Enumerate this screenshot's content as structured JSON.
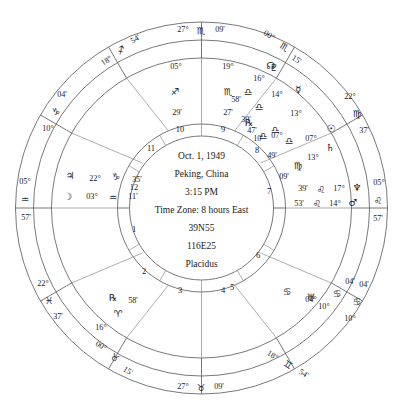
{
  "chart_info": {
    "type": "natal-wheel",
    "house_system": "Placidus",
    "center_lines": [
      "Oct. 1, 1949",
      "Peking, China",
      "3:15 PM",
      "Time Zone: 8 hours East",
      "39N55",
      "116E25",
      "Placidus"
    ]
  },
  "glyphs": {
    "aries": "♈",
    "taurus": "♉",
    "gemini": "♊",
    "cancer": "♋",
    "leo": "♌",
    "virgo": "♍",
    "libra": "♎",
    "scorpio": "♏",
    "sagittarius": "♐",
    "capricorn": "♑",
    "aquarius": "♒",
    "pisces": "♓",
    "sun": "☉",
    "moon": "☽",
    "mercury": "☿",
    "venus": "♀",
    "mars": "♂",
    "jupiter": "♃",
    "saturn": "♄",
    "uranus": "♅",
    "neptune": "♆",
    "pluto": "♇",
    "north_node": "☊",
    "retrograde": "℞"
  },
  "outer_ring_labels": [
    {
      "id": "mc",
      "deg": "27°",
      "sign": "scorpio",
      "min": "09'",
      "x": 201,
      "y": 30,
      "rot": 0,
      "layout": "row"
    },
    {
      "id": "house11",
      "deg": "18°",
      "sign": "sagittarius",
      "min": "54'",
      "x": 121,
      "y": 50,
      "rot": -32,
      "layout": "row"
    },
    {
      "id": "house12",
      "deg": "10°",
      "sign": "capricorn",
      "min": "04'",
      "x": 55,
      "y": 111,
      "rot": -63,
      "layout": "stack"
    },
    {
      "id": "asc",
      "deg": "05°",
      "sign": "aquarius",
      "min": "57'",
      "x": 24,
      "y": 194,
      "rot": -90,
      "layout": "stack"
    },
    {
      "id": "house2",
      "deg": "22°",
      "sign": "pisces",
      "min": "37'",
      "x": 42,
      "y": 294,
      "rot": -118,
      "layout": "stack"
    },
    {
      "id": "house3",
      "deg": "00°",
      "sign": "taurus",
      "min": "15'",
      "x": 110,
      "y": 358,
      "rot": -148,
      "layout": "row"
    },
    {
      "id": "ic",
      "deg": "27°",
      "sign": "taurus",
      "min": "09'",
      "x": 201,
      "y": 387,
      "rot": 0,
      "layout": "row"
    },
    {
      "id": "house5",
      "deg": "18°",
      "sign": "gemini",
      "min": "54'",
      "x": 289,
      "y": 365,
      "rot": 32,
      "layout": "row"
    },
    {
      "id": "house6",
      "deg": "10°",
      "sign": "cancer",
      "min": "04'",
      "x": 355,
      "y": 299,
      "rot": 63,
      "layout": "stack"
    },
    {
      "id": "dsc",
      "deg": "05°",
      "sign": "leo",
      "min": "57'",
      "x": 380,
      "y": 196,
      "rot": 90,
      "layout": "stack"
    },
    {
      "id": "house8",
      "deg": "22°",
      "sign": "virgo",
      "min": "37'",
      "x": 360,
      "y": 107,
      "rot": 118,
      "layout": "stack"
    },
    {
      "id": "house9",
      "deg": "00°",
      "sign": "scorpio",
      "min": "15'",
      "x": 279,
      "y": 44,
      "rot": 148,
      "layout": "row"
    }
  ],
  "house_cusps": [
    {
      "number": "10",
      "deg": "05°",
      "sign": "sagittarius",
      "min": "29'",
      "num_x": 180,
      "num_y": 128,
      "lx": 171,
      "ly": 70
    },
    {
      "number": "9",
      "deg": "19°",
      "sign": "scorpio",
      "min": "27'",
      "num_x": 222,
      "num_y": 128,
      "lx": 230,
      "ly": 70
    },
    {
      "number": "8",
      "deg": "07°",
      "sign": "libra",
      "min": "47'",
      "num_x": 258,
      "num_y": 148,
      "lx": 278,
      "ly": 101
    },
    {
      "number": "7",
      "deg": "",
      "sign": "",
      "min": "",
      "num_x": 271,
      "num_y": 193,
      "lx": 0,
      "ly": 0
    },
    {
      "number": "6",
      "deg": "",
      "sign": "",
      "min": "",
      "num_x": 258,
      "num_y": 256,
      "lx": 0,
      "ly": 0
    },
    {
      "number": "5",
      "deg": "",
      "sign": "",
      "min": "",
      "num_x": 231,
      "num_y": 288,
      "lx": 0,
      "ly": 0
    },
    {
      "number": "4",
      "deg": "",
      "sign": "",
      "min": "",
      "num_x": 222,
      "num_y": 290,
      "lx": 0,
      "ly": 0
    },
    {
      "number": "3",
      "deg": "",
      "sign": "",
      "min": "",
      "num_x": 180,
      "num_y": 290,
      "lx": 0,
      "ly": 0
    },
    {
      "number": "2",
      "deg": "",
      "sign": "",
      "min": "",
      "num_x": 143,
      "num_y": 272,
      "lx": 0,
      "ly": 0
    },
    {
      "number": "1",
      "deg": "",
      "sign": "",
      "min": "",
      "num_x": 133,
      "num_y": 228,
      "lx": 0,
      "ly": 0
    },
    {
      "number": "12",
      "deg": "",
      "sign": "",
      "min": "",
      "num_x": 133,
      "num_y": 186,
      "lx": 0,
      "ly": 0
    },
    {
      "number": "11",
      "deg": "",
      "sign": "",
      "min": "",
      "num_x": 150,
      "num_y": 147,
      "lx": 0,
      "ly": 0
    }
  ],
  "cusp_texts": [
    {
      "id": "cusp-10",
      "deg": "05°",
      "sign": "sagittarius",
      "min": "29'",
      "x": 175,
      "y": 78
    },
    {
      "id": "cusp-9",
      "deg": "19°",
      "sign": "scorpio",
      "min": "27'",
      "x": 227,
      "y": 78
    },
    {
      "id": "cusp-8",
      "deg": "07°",
      "sign": "libra",
      "min": "47'",
      "x": 268,
      "y": 131
    },
    {
      "id": "cusp-3",
      "deg": "16°",
      "sign": "aries",
      "min": "58'",
      "x": 119,
      "y": 319
    },
    {
      "id": "cusp-6",
      "deg": "04°",
      "sign": "cancer",
      "min": "",
      "x": 309,
      "y": 295
    }
  ],
  "planets": [
    {
      "id": "pluto",
      "name": "pluto",
      "deg": "16°",
      "sign": "libra",
      "min": "58'",
      "retro": false,
      "gx": 272,
      "gy": 67,
      "dx": 257,
      "dy": 79,
      "sx": 246,
      "sy": 90,
      "mx": 236,
      "my": 101
    },
    {
      "id": "neptune",
      "name": "neptune",
      "deg": "17°",
      "sign": "leo",
      "min": "39'",
      "retro": false,
      "gx": 357,
      "gy": 189,
      "dx": 338,
      "dy": 189,
      "sx": 321,
      "sy": 190,
      "mx": 303,
      "my": 190
    },
    {
      "id": "mercury",
      "name": "mercury",
      "deg": "14°",
      "sign": "libra",
      "min": "39'",
      "retro": true,
      "gx": 299,
      "gy": 107,
      "dx": 280,
      "dy": 104,
      "sx": 265,
      "sy": 105,
      "mx": 248,
      "my": 120
    },
    {
      "id": "mars",
      "name": "mars",
      "deg": "14°",
      "sign": "leo",
      "min": "53'",
      "retro": false,
      "gx": 352,
      "gy": 203,
      "dx": 334,
      "dy": 203,
      "sx": 317,
      "sy": 203,
      "mx": 299,
      "my": 203
    },
    {
      "id": "venus",
      "name": "venus",
      "deg": "13°",
      "sign": "libra",
      "min": "10'",
      "retro": false,
      "gx": 319,
      "gy": 124,
      "dx": 301,
      "dy": 123,
      "sx": 287,
      "sy": 131,
      "mx": 271,
      "my": 139
    },
    {
      "id": "sun",
      "name": "sun",
      "deg": "07°",
      "sign": "libra",
      "min": "49'",
      "retro": false,
      "gx": 330,
      "gy": 128,
      "dx": 311,
      "dy": 140,
      "sx": 295,
      "sy": 140,
      "mx": 283,
      "my": 155
    },
    {
      "id": "saturn",
      "name": "saturn",
      "deg": "13°",
      "sign": "virgo",
      "min": "09'",
      "retro": false,
      "gx": 330,
      "gy": 148,
      "dx": 312,
      "dy": 159,
      "sx": 297,
      "sy": 166,
      "mx": 284,
      "my": 176
    },
    {
      "id": "jupiter",
      "name": "jupiter",
      "deg": "22°",
      "sign": "capricorn",
      "min": "35'",
      "x0": 73,
      "y0": 176
    },
    {
      "id": "moon",
      "name": "moon",
      "deg": "03°",
      "sign": "aquarius",
      "min": "11'",
      "x0": 66,
      "y0": 196
    },
    {
      "id": "uranus",
      "name": "uranus",
      "deg": "04°",
      "sign": "cancer",
      "min": "",
      "x0": 294,
      "y0": 303
    },
    {
      "id": "northnode",
      "name": "north_node",
      "deg": "",
      "sign": "",
      "min": "",
      "x0": 271,
      "y0": 66
    }
  ],
  "planet_rows": [
    {
      "id": "jupiter-row",
      "glyph": "jupiter",
      "deg": "22°",
      "sign": "capricorn",
      "min": "35'",
      "gx": 70,
      "gy": 176,
      "dx": 95,
      "dy": 178,
      "sx": 117,
      "sy": 177,
      "mx": 139,
      "my": 179
    },
    {
      "id": "moon-row",
      "glyph": "moon",
      "deg": "03°",
      "sign": "aquarius",
      "min": "11'",
      "gx": 68,
      "gy": 196,
      "dx": 92,
      "dy": 196,
      "sx": 114,
      "sy": 197,
      "mx": 135,
      "my": 197
    },
    {
      "id": "uranus-row",
      "glyph": "uranus",
      "deg": "10°",
      "sign": "cancer",
      "min": "04'",
      "gx": 331,
      "gy": 305,
      "dx": 348,
      "dy": 310,
      "sx": 361,
      "sy": 296,
      "mx": 368,
      "my": 285
    },
    {
      "id": "uranus-in",
      "glyph": "uranus",
      "deg": "04°",
      "sign": "cancer",
      "min": "",
      "gx": 311,
      "gy": 295,
      "dx": 322,
      "dy": 302,
      "sx": 303,
      "sy": 289,
      "mx": 0,
      "my": 0
    }
  ],
  "labels": {
    "retro_marks": [
      {
        "x": 249,
        "y": 122
      },
      {
        "x": 113,
        "y": 297
      }
    ]
  }
}
